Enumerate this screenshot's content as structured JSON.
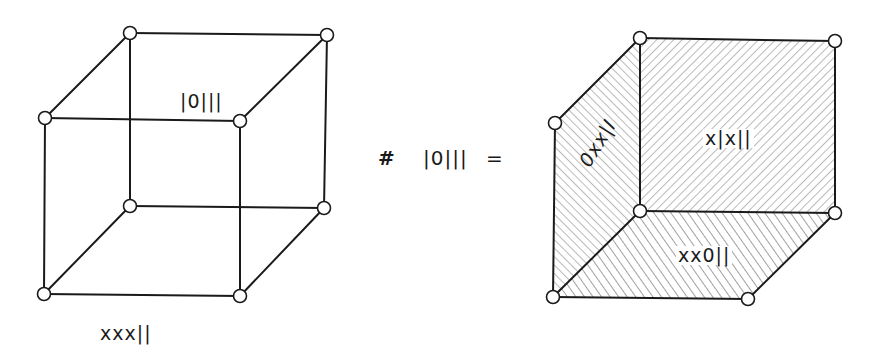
{
  "diagram": {
    "left_cube": {
      "face_label_top": "|0|||",
      "bottom_label": "xxx||"
    },
    "operator": {
      "symbol": "#",
      "operand": "|0|||",
      "equals": "="
    },
    "right_cube": {
      "face_label_left": "0xx|I",
      "face_label_back": "x|x||",
      "face_label_bottom": "xx0||"
    },
    "colors": {
      "line": "#1a1a1a",
      "background": "#ffffff",
      "hatch": "#555555"
    }
  }
}
